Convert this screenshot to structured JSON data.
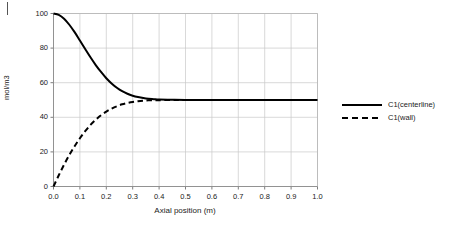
{
  "figure": {
    "corner_mark": "tick-mark"
  },
  "chart_data": {
    "type": "line",
    "title": "",
    "subtitle": "",
    "xlabel": "Axial position (m)",
    "ylabel": "mol/m3",
    "xlim": [
      0.0,
      1.0
    ],
    "ylim": [
      0,
      100
    ],
    "grid": true,
    "legend_position": "right",
    "x_ticks": [
      "0.0",
      "0.1",
      "0.2",
      "0.3",
      "0.4",
      "0.5",
      "0.6",
      "0.7",
      "0.8",
      "0.9",
      "1.0"
    ],
    "x_tick_values": [
      0.0,
      0.1,
      0.2,
      0.3,
      0.4,
      0.5,
      0.6,
      0.7,
      0.8,
      0.9,
      1.0
    ],
    "y_ticks": [
      "0",
      "20",
      "40",
      "60",
      "80",
      "100"
    ],
    "y_tick_values": [
      0,
      20,
      40,
      60,
      80,
      100
    ],
    "x": [
      0.0,
      0.02,
      0.04,
      0.06,
      0.08,
      0.1,
      0.12,
      0.14,
      0.16,
      0.18,
      0.2,
      0.22,
      0.24,
      0.26,
      0.28,
      0.3,
      0.32,
      0.34,
      0.36,
      0.38,
      0.4,
      0.45,
      0.5,
      0.6,
      0.7,
      0.8,
      0.9,
      1.0
    ],
    "series": [
      {
        "name": "C1(centerline)",
        "style": "solid",
        "color": "#000000",
        "values": [
          100.0,
          99.2,
          97.0,
          93.5,
          89.2,
          84.4,
          79.5,
          74.7,
          70.2,
          66.2,
          62.6,
          59.6,
          57.1,
          55.1,
          53.6,
          52.5,
          51.7,
          51.1,
          50.7,
          50.5,
          50.3,
          50.1,
          50.0,
          50.0,
          50.0,
          50.0,
          50.0,
          50.0
        ]
      },
      {
        "name": "C1(wall)",
        "style": "dashed",
        "color": "#000000",
        "values": [
          0.0,
          6.5,
          12.6,
          18.2,
          23.3,
          27.9,
          32.0,
          35.6,
          38.6,
          41.2,
          43.3,
          45.0,
          46.4,
          47.5,
          48.3,
          48.9,
          49.3,
          49.6,
          49.8,
          49.9,
          49.9,
          50.0,
          50.0,
          50.0,
          50.0,
          50.0,
          50.0,
          50.0
        ]
      }
    ]
  },
  "legend": {
    "items": [
      {
        "label": "C1(centerline)",
        "style": "solid"
      },
      {
        "label": "C1(wall)",
        "style": "dashed"
      }
    ]
  }
}
